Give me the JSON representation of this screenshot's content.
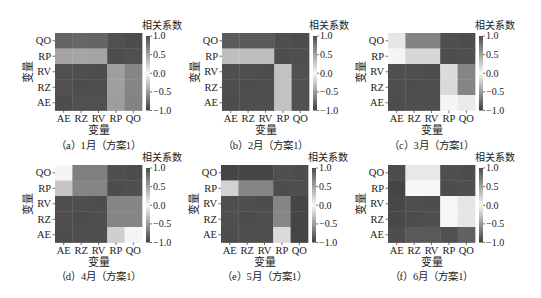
{
  "colormap": {
    "pos": "#4d4d4d",
    "zero": "#f7f7f7",
    "neg": "#3f3f3f"
  },
  "chart_data": [
    {
      "type": "heatmap",
      "title": "（a）1月（方案1）",
      "xlabel": "变量",
      "ylabel": "变量",
      "x_categories": [
        "AE",
        "RZ",
        "RV",
        "RP",
        "QO"
      ],
      "y_categories": [
        "QO",
        "RP",
        "RV",
        "RZ",
        "AE"
      ],
      "values": [
        [
          -0.8,
          -0.79,
          -0.8,
          0.98,
          1.0
        ],
        [
          -0.45,
          -0.44,
          -0.45,
          1.0,
          0.98
        ],
        [
          0.98,
          0.99,
          1.0,
          -0.48,
          -0.62
        ],
        [
          0.98,
          1.0,
          0.99,
          -0.48,
          -0.62
        ],
        [
          1.0,
          0.98,
          0.98,
          -0.49,
          -0.63
        ]
      ],
      "colorbar": {
        "label": "相关系数",
        "range": [
          -1,
          1
        ],
        "tick_values": [
          1,
          0.5,
          0,
          -0.5,
          -1
        ],
        "ticks": [
          "1.0",
          "0.5",
          "0.0",
          "−0.5",
          "−1.0"
        ]
      }
    },
    {
      "type": "heatmap",
      "title": "（b）2月（方案1）",
      "xlabel": "变量",
      "ylabel": "变量",
      "x_categories": [
        "AE",
        "RZ",
        "RV",
        "RP",
        "QO"
      ],
      "y_categories": [
        "QO",
        "RP",
        "RV",
        "RZ",
        "AE"
      ],
      "values": [
        [
          -0.85,
          -0.85,
          -0.85,
          0.99,
          1.0
        ],
        [
          -0.31,
          -0.31,
          -0.31,
          1.0,
          0.99
        ],
        [
          0.99,
          0.99,
          1.0,
          -0.29,
          -0.9
        ],
        [
          0.99,
          1.0,
          0.99,
          -0.29,
          -0.9
        ],
        [
          1.0,
          0.99,
          0.99,
          -0.29,
          -0.9
        ]
      ],
      "colorbar": {
        "label": "相关系数",
        "range": [
          -1,
          1
        ],
        "tick_values": [
          1,
          0.5,
          0,
          -0.5,
          -1
        ],
        "ticks": [
          "1.0",
          "0.5",
          "0.0",
          "−0.5",
          "−1.0"
        ]
      }
    },
    {
      "type": "heatmap",
      "title": "（c）3月（方案1）",
      "xlabel": "变量",
      "ylabel": "变量",
      "x_categories": [
        "AE",
        "RZ",
        "RV",
        "RP",
        "QO"
      ],
      "y_categories": [
        "QO",
        "RP",
        "RV",
        "RZ",
        "AE"
      ],
      "values": [
        [
          -0.09,
          -0.63,
          -0.63,
          0.99,
          1.0
        ],
        [
          0.01,
          -0.18,
          -0.18,
          1.0,
          0.99
        ],
        [
          0.99,
          0.99,
          1.0,
          -0.15,
          -0.62
        ],
        [
          0.99,
          1.0,
          0.99,
          -0.16,
          -0.62
        ],
        [
          1.0,
          0.99,
          0.99,
          0.01,
          -0.07
        ]
      ],
      "colorbar": {
        "label": "相关系数",
        "range": [
          -1,
          1
        ],
        "tick_values": [
          1,
          0.5,
          0,
          -0.5,
          -1
        ],
        "ticks": [
          "1.0",
          "0.5",
          "0.0",
          "−0.5",
          "−1.0"
        ]
      }
    },
    {
      "type": "heatmap",
      "title": "（d）4月（方案1）",
      "xlabel": "变量",
      "ylabel": "变量",
      "x_categories": [
        "AE",
        "RZ",
        "RV",
        "RP",
        "QO"
      ],
      "y_categories": [
        "QO",
        "RP",
        "RV",
        "RZ",
        "AE"
      ],
      "values": [
        [
          0.01,
          -0.65,
          -0.65,
          0.99,
          1.0
        ],
        [
          -0.27,
          -0.62,
          -0.62,
          1.0,
          0.99
        ],
        [
          0.99,
          0.99,
          1.0,
          -0.62,
          -0.62
        ],
        [
          0.99,
          1.0,
          0.99,
          -0.62,
          -0.62
        ],
        [
          1.0,
          0.99,
          0.99,
          -0.22,
          0.01
        ]
      ],
      "colorbar": {
        "label": "相关系数",
        "range": [
          -1,
          1
        ],
        "tick_values": [
          1,
          0.5,
          0,
          -0.5,
          -1
        ],
        "ticks": [
          "1.0",
          "0.5",
          "0.0",
          "−0.5",
          "−1.0"
        ]
      }
    },
    {
      "type": "heatmap",
      "title": "（e）5月（方案1）",
      "xlabel": "变量",
      "ylabel": "变量",
      "x_categories": [
        "AE",
        "RZ",
        "RV",
        "RP",
        "QO"
      ],
      "y_categories": [
        "QO",
        "RP",
        "RV",
        "RZ",
        "AE"
      ],
      "values": [
        [
          -0.97,
          -0.97,
          -0.97,
          0.99,
          1.0
        ],
        [
          -0.2,
          -0.62,
          -0.62,
          1.0,
          0.99
        ],
        [
          0.99,
          0.99,
          1.0,
          -0.62,
          -0.97
        ],
        [
          0.99,
          1.0,
          0.99,
          -0.61,
          -0.97
        ],
        [
          1.0,
          0.99,
          0.99,
          -0.15,
          -0.97
        ]
      ],
      "colorbar": {
        "label": "相关系数",
        "range": [
          -1,
          1
        ],
        "tick_values": [
          1,
          0.5,
          0,
          -0.5,
          -1
        ],
        "ticks": [
          "1.0",
          "0.5",
          "0.0",
          "−0.5",
          "−1.0"
        ]
      }
    },
    {
      "type": "heatmap",
      "title": "（f）6月（方案1）",
      "xlabel": "变量",
      "ylabel": "变量",
      "x_categories": [
        "AE",
        "RZ",
        "RV",
        "RP",
        "QO"
      ],
      "y_categories": [
        "QO",
        "RP",
        "RV",
        "RZ",
        "AE"
      ],
      "values": [
        [
          -0.93,
          0.09,
          0.09,
          0.99,
          1.0
        ],
        [
          -0.97,
          0.0,
          0.0,
          1.0,
          0.99
        ],
        [
          -0.95,
          0.99,
          1.0,
          0.0,
          0.1
        ],
        [
          -0.95,
          1.0,
          0.99,
          0.0,
          0.1
        ],
        [
          1.0,
          0.93,
          0.93,
          -0.91,
          -0.81
        ]
      ],
      "colorbar": {
        "label": "相关系数",
        "range": [
          -1,
          1
        ],
        "tick_values": [
          1,
          0.5,
          0,
          -0.5,
          -1
        ],
        "ticks": [
          "1.0",
          "0.5",
          "0.0",
          "−0.5",
          "−1.0"
        ]
      }
    }
  ]
}
